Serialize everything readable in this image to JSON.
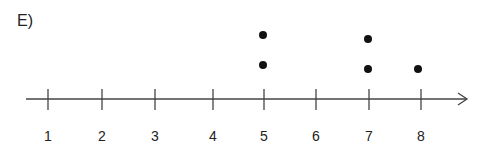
{
  "panel": {
    "label": "E)"
  },
  "chart_data": {
    "type": "scatter",
    "subtype": "dot_plot",
    "title": "",
    "xlabel": "",
    "ylabel": "",
    "x_ticks": [
      1,
      2,
      3,
      4,
      5,
      6,
      7,
      8
    ],
    "tick_labels": [
      "1",
      "2",
      "3",
      "4",
      "5",
      "6",
      "7",
      "8"
    ],
    "points": [
      {
        "x": 5,
        "count": 2
      },
      {
        "x": 7,
        "count": 2
      },
      {
        "x": 8,
        "count": 1
      }
    ],
    "values": [
      5,
      5,
      7,
      7,
      8
    ],
    "axis_arrow": true,
    "grid": false,
    "legend": null,
    "colors": {
      "axis": "#444444",
      "dot": "#111111",
      "text": "#222222"
    },
    "layout": {
      "axis_y": 99,
      "axis_x_start": 26,
      "axis_x_end": 467,
      "tick_px": [
        48,
        102,
        155,
        213,
        264,
        316,
        369,
        421
      ],
      "tick_top": 89,
      "tick_bottom": 110,
      "label_y": 141,
      "dot_px": [
        {
          "x": 263,
          "y": 65
        },
        {
          "x": 263,
          "y": 35
        },
        {
          "x": 368,
          "y": 69
        },
        {
          "x": 368,
          "y": 39
        },
        {
          "x": 418,
          "y": 69
        }
      ],
      "dot_r": 4
    }
  }
}
